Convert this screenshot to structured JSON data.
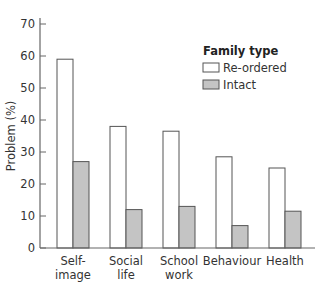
{
  "chart_data": {
    "type": "bar",
    "title": "",
    "xlabel": "",
    "ylabel": "Problem (%)",
    "ylim": [
      0,
      70
    ],
    "yticks": [
      0,
      10,
      20,
      30,
      40,
      50,
      60,
      70
    ],
    "grid": false,
    "legend_position": "upper right",
    "legend_title": "Family type",
    "categories": [
      [
        "Self-",
        "image"
      ],
      [
        "Social",
        "life"
      ],
      [
        "School",
        "work"
      ],
      [
        "Behaviour"
      ],
      [
        "Health"
      ]
    ],
    "series": [
      {
        "name": "Re-ordered",
        "color": "#ffffff",
        "stroke": "#555555",
        "values": [
          59,
          38,
          36.5,
          28.5,
          25
        ]
      },
      {
        "name": "Intact",
        "color": "#c4c4c4",
        "stroke": "#555555",
        "values": [
          27,
          12,
          13,
          7,
          11.5
        ]
      }
    ]
  }
}
